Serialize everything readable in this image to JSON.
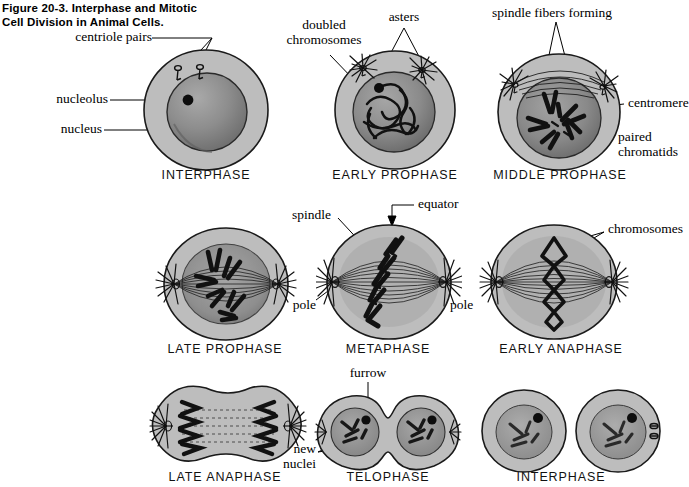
{
  "figure": {
    "title_line1": "Figure 20-3. Interphase and Mitotic",
    "title_line2": "Cell Division in Animal Cells."
  },
  "labels": {
    "centriole_pairs": "centriole pairs",
    "nucleolus": "nucleolus",
    "nucleus": "nucleus",
    "doubled_line1": "doubled",
    "doubled_line2": "chromosomes",
    "asters": "asters",
    "spindle_fibers_forming": "spindle fibers forming",
    "centromere": "centromere",
    "paired_line1": "paired",
    "paired_line2": "chromatids",
    "spindle": "spindle",
    "equator": "equator",
    "pole_left": "pole",
    "pole_right": "pole",
    "chromosomes": "chromosomes",
    "furrow": "furrow",
    "new_line1": "new",
    "new_line2": "nuclei"
  },
  "stages": [
    {
      "id": "interphase-1",
      "caption": "INTERPHASE"
    },
    {
      "id": "early-prophase",
      "caption": "EARLY PROPHASE"
    },
    {
      "id": "middle-prophase",
      "caption": "MIDDLE PROPHASE"
    },
    {
      "id": "late-prophase",
      "caption": "LATE PROPHASE"
    },
    {
      "id": "metaphase",
      "caption": "METAPHASE"
    },
    {
      "id": "early-anaphase",
      "caption": "EARLY ANAPHASE"
    },
    {
      "id": "late-anaphase",
      "caption": "LATE ANAPHASE"
    },
    {
      "id": "telophase",
      "caption": "TELOPHASE"
    },
    {
      "id": "interphase-2",
      "caption": "INTERPHASE"
    }
  ],
  "colors": {
    "cytoplasm": "#b9b9b9",
    "nucleus_fill": "#8f8f8f",
    "outline": "#1a1a1a",
    "chromatin": "#111111",
    "background": "#ffffff"
  }
}
